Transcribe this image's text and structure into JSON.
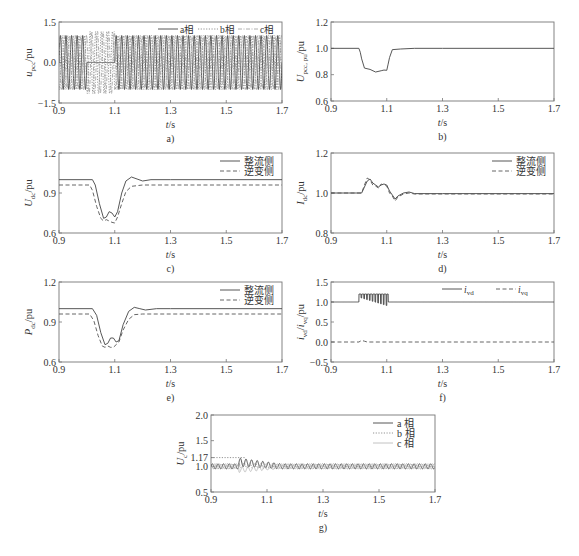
{
  "figure": {
    "panels": [
      "a)",
      "b)",
      "c)",
      "d)",
      "e)",
      "f)",
      "g)"
    ]
  },
  "chart_data": [
    {
      "id": "a",
      "type": "line",
      "caption": "a)",
      "xlabel": "t/s",
      "ylabel": "u_pcc/pu",
      "ylabel_main": "u",
      "ylabel_sub": "pcc",
      "ylabel_unit": "/pu",
      "xlim": [
        0.9,
        1.7
      ],
      "ylim": [
        -1.5,
        1.5
      ],
      "xticks": [
        0.9,
        1.1,
        1.3,
        1.5,
        1.7
      ],
      "xtick_labels": [
        "0.9",
        "1.1",
        "1.3",
        "1.5",
        "1.7"
      ],
      "yticks": [
        -1.5,
        0.0,
        1.5
      ],
      "ytick_labels": [
        "-1.5",
        "0.0",
        "1.5"
      ],
      "grid": false,
      "legend": {
        "position": "top-right",
        "orientation": "horizontal",
        "entries": [
          "a相",
          "b相",
          "c相"
        ]
      },
      "description": "Three-phase 50 Hz sinusoidal PCC voltages, amplitude 1.0 pu. Between 1.0 s and 1.1 s phase a drops to 0 (single-phase fault); phases b and c continue oscillating with slightly increased amplitude (~1.1 pu).",
      "series": [
        {
          "name": "a相",
          "style": "solid",
          "amplitude": 1.0,
          "freq_hz": 50,
          "phase_deg": 0,
          "segments": [
            {
              "t0": 0.9,
              "t1": 1.0,
              "amp": 1.0
            },
            {
              "t0": 1.0,
              "t1": 1.1,
              "amp": 0.0
            },
            {
              "t0": 1.1,
              "t1": 1.7,
              "amp": 1.0
            }
          ]
        },
        {
          "name": "b相",
          "style": "dotted",
          "amplitude": 1.0,
          "freq_hz": 50,
          "phase_deg": -120,
          "segments": [
            {
              "t0": 0.9,
              "t1": 1.0,
              "amp": 1.0
            },
            {
              "t0": 1.0,
              "t1": 1.1,
              "amp": 1.15
            },
            {
              "t0": 1.1,
              "t1": 1.7,
              "amp": 1.0
            }
          ]
        },
        {
          "name": "c相",
          "style": "dash-dot",
          "amplitude": 1.0,
          "freq_hz": 50,
          "phase_deg": 120,
          "segments": [
            {
              "t0": 0.9,
              "t1": 1.0,
              "amp": 1.0
            },
            {
              "t0": 1.0,
              "t1": 1.1,
              "amp": 1.15
            },
            {
              "t0": 1.1,
              "t1": 1.7,
              "amp": 1.0
            }
          ]
        }
      ]
    },
    {
      "id": "b",
      "type": "line",
      "caption": "b)",
      "xlabel": "t/s",
      "ylabel": "U_pcc,pu/pu",
      "ylabel_main": "U",
      "ylabel_sub": "pcc, pu",
      "ylabel_unit": "/pu",
      "xlim": [
        0.9,
        1.7
      ],
      "ylim": [
        0.6,
        1.2
      ],
      "xticks": [
        0.9,
        1.1,
        1.3,
        1.5,
        1.7
      ],
      "xtick_labels": [
        "0.9",
        "1.1",
        "1.3",
        "1.5",
        "1.7"
      ],
      "yticks": [
        0.6,
        0.8,
        1.0,
        1.2
      ],
      "ytick_labels": [
        "0.6",
        "0.8",
        "1.0",
        "1.2"
      ],
      "grid": false,
      "legend": null,
      "series": [
        {
          "name": "U_pcc",
          "style": "solid",
          "x": [
            0.9,
            1.0,
            1.005,
            1.01,
            1.02,
            1.04,
            1.06,
            1.08,
            1.09,
            1.1,
            1.105,
            1.11,
            1.12,
            1.15,
            1.2,
            1.3,
            1.7
          ],
          "y": [
            1.0,
            1.0,
            0.97,
            0.92,
            0.85,
            0.84,
            0.82,
            0.83,
            0.835,
            0.833,
            0.88,
            0.93,
            0.99,
            0.995,
            1.0,
            1.0,
            1.0
          ]
        }
      ]
    },
    {
      "id": "c",
      "type": "line",
      "caption": "c)",
      "xlabel": "t/s",
      "ylabel": "U_dc/pu",
      "ylabel_main": "U",
      "ylabel_sub": "dc",
      "ylabel_unit": "/pu",
      "xlim": [
        0.9,
        1.7
      ],
      "ylim": [
        0.6,
        1.2
      ],
      "xticks": [
        0.9,
        1.1,
        1.3,
        1.5,
        1.7
      ],
      "xtick_labels": [
        "0.9",
        "1.1",
        "1.3",
        "1.5",
        "1.7"
      ],
      "yticks": [
        0.6,
        0.9,
        1.2
      ],
      "ytick_labels": [
        "0.6",
        "0.9",
        "1.2"
      ],
      "grid": false,
      "legend": {
        "position": "top-right",
        "orientation": "vertical",
        "entries": [
          "整流侧",
          "逆变侧"
        ]
      },
      "series": [
        {
          "name": "整流侧",
          "style": "solid",
          "x": [
            0.9,
            1.02,
            1.03,
            1.045,
            1.06,
            1.07,
            1.08,
            1.09,
            1.1,
            1.11,
            1.125,
            1.14,
            1.16,
            1.18,
            1.2,
            1.23,
            1.3,
            1.7
          ],
          "y": [
            1.0,
            1.0,
            0.96,
            0.82,
            0.71,
            0.72,
            0.76,
            0.75,
            0.72,
            0.76,
            0.9,
            0.99,
            1.02,
            1.005,
            0.99,
            1.0,
            1.0,
            1.0
          ]
        },
        {
          "name": "逆变侧",
          "style": "dashed",
          "x": [
            0.9,
            1.01,
            1.02,
            1.035,
            1.05,
            1.06,
            1.07,
            1.08,
            1.09,
            1.1,
            1.11,
            1.125,
            1.14,
            1.16,
            1.2,
            1.3,
            1.7
          ],
          "y": [
            0.96,
            0.96,
            0.92,
            0.8,
            0.71,
            0.69,
            0.7,
            0.69,
            0.68,
            0.675,
            0.72,
            0.82,
            0.91,
            0.95,
            0.96,
            0.96,
            0.96
          ]
        }
      ]
    },
    {
      "id": "d",
      "type": "line",
      "caption": "d)",
      "xlabel": "t/s",
      "ylabel": "I_dc/pu",
      "ylabel_main": "I",
      "ylabel_sub": "dc",
      "ylabel_unit": "/pu",
      "xlim": [
        0.9,
        1.7
      ],
      "ylim": [
        0.8,
        1.2
      ],
      "xticks": [
        0.9,
        1.1,
        1.3,
        1.5,
        1.7
      ],
      "xtick_labels": [
        "0.9",
        "1.1",
        "1.3",
        "1.5",
        "1.7"
      ],
      "yticks": [
        0.8,
        1.0,
        1.2
      ],
      "ytick_labels": [
        "0.8",
        "1.0",
        "1.2"
      ],
      "grid": false,
      "legend": {
        "position": "top-right",
        "orientation": "vertical",
        "entries": [
          "整流侧",
          "逆变侧"
        ]
      },
      "series": [
        {
          "name": "整流侧",
          "style": "solid",
          "x": [
            0.9,
            1.01,
            1.02,
            1.03,
            1.04,
            1.05,
            1.06,
            1.07,
            1.08,
            1.09,
            1.1,
            1.11,
            1.12,
            1.13,
            1.14,
            1.16,
            1.18,
            1.2,
            1.3,
            1.7
          ],
          "y": [
            1.0,
            1.0,
            1.03,
            1.06,
            1.07,
            1.05,
            1.04,
            1.03,
            1.04,
            1.045,
            1.04,
            1.01,
            0.99,
            0.97,
            0.985,
            1.0,
            1.005,
            0.997,
            0.997,
            0.997
          ]
        },
        {
          "name": "逆变侧",
          "style": "dashed",
          "x": [
            0.9,
            1.01,
            1.02,
            1.03,
            1.04,
            1.05,
            1.06,
            1.07,
            1.08,
            1.09,
            1.1,
            1.11,
            1.12,
            1.13,
            1.14,
            1.16,
            1.18,
            1.2,
            1.3,
            1.7
          ],
          "y": [
            1.0,
            1.0,
            1.04,
            1.075,
            1.065,
            1.04,
            1.035,
            1.025,
            1.045,
            1.04,
            1.035,
            1.0,
            0.985,
            0.96,
            0.98,
            0.995,
            1.0,
            0.995,
            0.995,
            0.995
          ]
        }
      ]
    },
    {
      "id": "e",
      "type": "line",
      "caption": "e)",
      "xlabel": "t/s",
      "ylabel": "P_dc/pu",
      "ylabel_main": "P",
      "ylabel_sub": "dc",
      "ylabel_unit": "/pu",
      "xlim": [
        0.9,
        1.7
      ],
      "ylim": [
        0.6,
        1.2
      ],
      "xticks": [
        0.9,
        1.1,
        1.3,
        1.5,
        1.7
      ],
      "xtick_labels": [
        "0.9",
        "1.1",
        "1.3",
        "1.5",
        "1.7"
      ],
      "yticks": [
        0.6,
        0.9,
        1.2
      ],
      "ytick_labels": [
        "0.6",
        "0.9",
        "1.2"
      ],
      "grid": false,
      "legend": {
        "position": "top-right",
        "orientation": "vertical",
        "entries": [
          "整流侧",
          "逆变侧"
        ]
      },
      "series": [
        {
          "name": "整流侧",
          "style": "solid",
          "x": [
            0.9,
            1.02,
            1.035,
            1.05,
            1.065,
            1.075,
            1.085,
            1.095,
            1.105,
            1.115,
            1.13,
            1.15,
            1.17,
            1.19,
            1.21,
            1.25,
            1.3,
            1.7
          ],
          "y": [
            1.0,
            1.0,
            0.95,
            0.82,
            0.73,
            0.74,
            0.78,
            0.78,
            0.75,
            0.76,
            0.88,
            0.98,
            1.01,
            1.0,
            0.99,
            1.0,
            1.0,
            1.0
          ]
        },
        {
          "name": "逆变侧",
          "style": "dashed",
          "x": [
            0.9,
            1.01,
            1.025,
            1.04,
            1.055,
            1.065,
            1.075,
            1.085,
            1.095,
            1.105,
            1.115,
            1.13,
            1.15,
            1.17,
            1.2,
            1.3,
            1.7
          ],
          "y": [
            0.96,
            0.96,
            0.91,
            0.8,
            0.72,
            0.71,
            0.72,
            0.71,
            0.71,
            0.73,
            0.75,
            0.84,
            0.92,
            0.955,
            0.96,
            0.96,
            0.96
          ]
        }
      ]
    },
    {
      "id": "f",
      "type": "line",
      "caption": "f)",
      "xlabel": "t/s",
      "ylabel": "i_vd/i_vq/pu",
      "ylabel_main": "i",
      "ylabel_sub": "vd",
      "ylabel_mid": "/i",
      "ylabel_sub2": "vq",
      "ylabel_unit": "/pu",
      "xlim": [
        0.9,
        1.7
      ],
      "ylim": [
        -0.5,
        1.5
      ],
      "xticks": [
        0.9,
        1.1,
        1.3,
        1.5,
        1.7
      ],
      "xtick_labels": [
        "0.9",
        "1.1",
        "1.3",
        "1.5",
        "1.7"
      ],
      "yticks": [
        -0.5,
        0.0,
        0.5,
        1.0,
        1.5
      ],
      "ytick_labels": [
        "-0.5",
        "0.0",
        "0.5",
        "1.0",
        "1.5"
      ],
      "grid": false,
      "legend": {
        "position": "top-right",
        "orientation": "horizontal",
        "entries": [
          "i_vd",
          "i_vq"
        ]
      },
      "description": "i_vd steady at 1.0; between 1.0 and 1.1 s it jumps to ~1.2 limit with oscillating dips down to ~0.9 (100 Hz). i_vq steady at 0 with small bump near 1.01 s.",
      "series": [
        {
          "name": "i_vd",
          "style": "solid",
          "baseline": 1.0,
          "oscillation": {
            "t0": 1.0,
            "t1": 1.105,
            "upper": 1.2,
            "lower_start": 1.12,
            "lower_end": 0.9,
            "freq_hz": 100
          }
        },
        {
          "name": "i_vq",
          "style": "dashed",
          "x": [
            0.9,
            1.0,
            1.01,
            1.02,
            1.03,
            1.7
          ],
          "y": [
            0.0,
            0.0,
            0.04,
            0.02,
            0.0,
            0.0
          ]
        }
      ]
    },
    {
      "id": "g",
      "type": "line",
      "caption": "g)",
      "xlabel": "t/s",
      "ylabel": "U_c/pu",
      "ylabel_main": "U",
      "ylabel_sub": "c",
      "ylabel_unit": "/pu",
      "xlim": [
        0.9,
        1.7
      ],
      "ylim": [
        0.5,
        2.0
      ],
      "xticks": [
        0.9,
        1.1,
        1.3,
        1.5,
        1.7
      ],
      "xtick_labels": [
        "0.9",
        "1.1",
        "1.3",
        "1.5",
        "1.7"
      ],
      "yticks": [
        0.5,
        1.0,
        1.17,
        1.5,
        2.0
      ],
      "ytick_labels": [
        "0.5",
        "1.0",
        "1.17",
        "1.5",
        "2.0"
      ],
      "annotations": [
        {
          "type": "hline-dotted",
          "y": 1.17,
          "x0": 0.9,
          "x1": 1.02,
          "label": "1.17"
        }
      ],
      "grid": false,
      "legend": {
        "position": "top-right",
        "orientation": "vertical",
        "entries": [
          "a 相",
          "b 相",
          "c 相"
        ]
      },
      "description": "Submodule capacitor voltages ripple around 1.0 pu (±0.05) at 50 Hz. After the 1.0 s fault, phase a rises to oscillate up to ~1.17 pu then decays by ~1.15 s; phase c dips to ~0.9 pu during fault.",
      "series": [
        {
          "name": "a 相",
          "style": "solid",
          "baseline": 1.0,
          "ripple": 0.05,
          "freq_hz": 50,
          "fault": {
            "t0": 1.0,
            "t1": 1.15,
            "peak": 1.17,
            "offset": 0.08
          }
        },
        {
          "name": "b 相",
          "style": "dotted",
          "baseline": 1.0,
          "ripple": 0.05,
          "freq_hz": 50,
          "fault": {
            "t0": 1.0,
            "t1": 1.15,
            "offset": 0.02
          }
        },
        {
          "name": "c 相",
          "style": "light-solid",
          "baseline": 1.0,
          "ripple": 0.05,
          "freq_hz": 50,
          "fault": {
            "t0": 1.0,
            "t1": 1.15,
            "offset": -0.07
          }
        }
      ]
    }
  ],
  "layout": {
    "frames": {
      "a": [
        59,
        22,
        282,
        103
      ],
      "b": [
        331,
        22,
        554,
        101
      ],
      "c": [
        59,
        153,
        282,
        233
      ],
      "d": [
        331,
        153,
        554,
        233
      ],
      "e": [
        59,
        282,
        282,
        362
      ],
      "f": [
        331,
        282,
        554,
        362
      ],
      "g": [
        211,
        415,
        435,
        492
      ]
    }
  }
}
